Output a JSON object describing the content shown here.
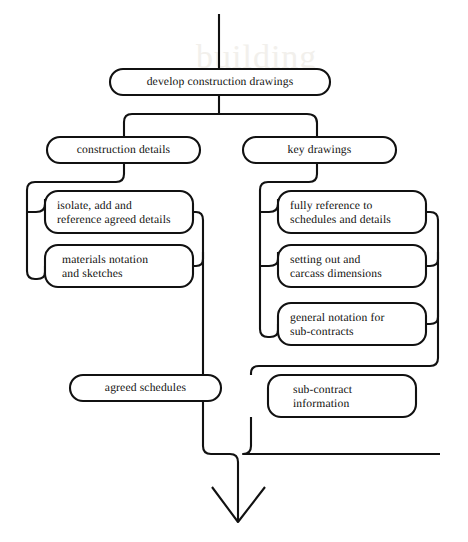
{
  "diagram": {
    "style": {
      "line_color": "#111111",
      "text_color": "#100f0d",
      "background": "#ffffff"
    },
    "nodes": [
      {
        "id": "develop-construction-drawings",
        "label": "develop construction drawings",
        "align": "center",
        "x": 110,
        "y": 69,
        "w": 220,
        "h": 26,
        "text_x": 110,
        "text_y": 75,
        "text_w": 220
      },
      {
        "id": "construction-details",
        "label": "construction  details",
        "align": "center",
        "x": 47,
        "y": 137,
        "w": 153,
        "h": 26,
        "text_x": 47,
        "text_y": 143,
        "text_w": 153
      },
      {
        "id": "key-drawings",
        "label": "key drawings",
        "align": "center",
        "x": 243,
        "y": 137,
        "w": 153,
        "h": 26,
        "text_x": 243,
        "text_y": 143,
        "text_w": 153
      },
      {
        "id": "isolate-add-reference",
        "label": "isolate, add and\nreference agreed details",
        "align": "left",
        "x": 45,
        "y": 191,
        "w": 148,
        "h": 42,
        "text_x": 57,
        "text_y": 199,
        "text_w": 130
      },
      {
        "id": "materials-notation",
        "label": "materials notation\nand sketches",
        "align": "left",
        "x": 45,
        "y": 245,
        "w": 148,
        "h": 42,
        "text_x": 62,
        "text_y": 253,
        "text_w": 130
      },
      {
        "id": "fully-reference",
        "label": "fully reference to\nschedules and details",
        "align": "left",
        "x": 278,
        "y": 191,
        "w": 148,
        "h": 42,
        "text_x": 290,
        "text_y": 199,
        "text_w": 132
      },
      {
        "id": "setting-out",
        "label": "setting out and\ncarcass dimensions",
        "align": "left",
        "x": 278,
        "y": 245,
        "w": 148,
        "h": 42,
        "text_x": 290,
        "text_y": 253,
        "text_w": 132
      },
      {
        "id": "general-notation",
        "label": "general notation for\nsub-contracts",
        "align": "left",
        "x": 278,
        "y": 303,
        "w": 148,
        "h": 42,
        "text_x": 290,
        "text_y": 311,
        "text_w": 132
      },
      {
        "id": "agreed-schedules",
        "label": "agreed schedules",
        "align": "center",
        "x": 70,
        "y": 375,
        "w": 151,
        "h": 26,
        "text_x": 70,
        "text_y": 381,
        "text_w": 151
      },
      {
        "id": "sub-contract-information",
        "label": "sub-contract\ninformation",
        "align": "left",
        "x": 268,
        "y": 375,
        "w": 148,
        "h": 42,
        "text_x": 293,
        "text_y": 383,
        "text_w": 120
      }
    ],
    "connectors": [
      {
        "id": "top-stem",
        "d": "M 219 14 L 219 69"
      },
      {
        "id": "split-stem-down",
        "d": "M 219 95 L 219 114"
      },
      {
        "id": "split-bar",
        "d": "M 124 137 L 124 122 Q 124 114 132 114 L 307 114 Q 317 114 317 123 L 317 137"
      },
      {
        "id": "left-branch-drop",
        "d": "M 124 163 L 124 174 Q 124 182 116 182 L 35 182 Q 27 182 27 190 L 27 271 Q 27 279 35 279 L 37 279 Q 45 279 45 272 L 45 266"
      },
      {
        "id": "left-feed-box1",
        "d": "M 27 212 L 36 212 Q 45 212 45 204 L 45 199"
      },
      {
        "id": "left-exit-box1",
        "d": "M 193 212 L 196 212 Q 203 212 203 220 L 203 375"
      },
      {
        "id": "left-exit-box2",
        "d": "M 193 266 L 196 266 Q 203 266 203 259 L 203 252"
      },
      {
        "id": "right-branch-drop",
        "d": "M 317 163 L 317 174 Q 317 182 309 182 L 268 182 Q 260 182 260 190 L 260 329 Q 260 337 268 337 L 270 337 Q 278 337 278 330 L 278 324"
      },
      {
        "id": "right-feed-box1",
        "d": "M 260 212 L 269 212 Q 278 212 278 204 L 278 199"
      },
      {
        "id": "right-feed-box2",
        "d": "M 260 266 L 269 266 Q 278 266 278 259 L 278 252"
      },
      {
        "id": "right-exit-box1",
        "d": "M 426 212 L 430 212 Q 438 212 438 220 L 438 358 Q 438 366 430 366 L 259 366 Q 251 366 251 373 L 251 375"
      },
      {
        "id": "right-exit-box2",
        "d": "M 426 266 L 430 266 Q 438 266 438 259 L 438 252"
      },
      {
        "id": "right-exit-box3",
        "d": "M 426 324 L 430 324 Q 438 324 438 317 L 438 310"
      },
      {
        "id": "agreed-out",
        "d": "M 203 401 L 203 446 Q 203 454 211 454 L 230 454 Q 238 454 238 462 L 238 520"
      },
      {
        "id": "subcontract-out",
        "d": "M 251 417 L 251 446 Q 251 454 243 454 L 440 454"
      },
      {
        "id": "arrow-head",
        "d": "M 212 487 L 238 522 L 265 487"
      }
    ],
    "ghost_watermark": {
      "text": "building",
      "x": 196,
      "y": 38
    }
  }
}
